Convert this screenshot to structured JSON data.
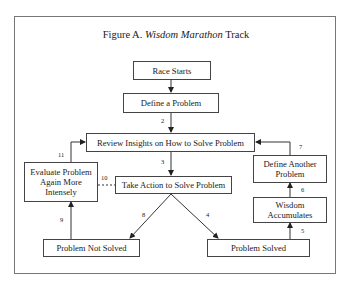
{
  "figure": {
    "title_prefix": "Figure A.",
    "title_italic": "Wisdom Marathon",
    "title_suffix": "Track"
  },
  "nodes": {
    "race_starts": "Race Starts",
    "define_problem": "Define a Problem",
    "review_insights": "Review Insights on How to Solve Problem",
    "take_action": "Take Action to Solve Problem",
    "evaluate_again": "Evaluate Problem Again More Intensely",
    "problem_not_solved": "Problem Not Solved",
    "problem_solved": "Problem Solved",
    "wisdom_accumulates": "Wisdom Accumulates",
    "define_another": "Define Another Problem"
  },
  "edges": [
    {
      "from": "race_starts",
      "to": "define_problem",
      "label": ""
    },
    {
      "from": "define_problem",
      "to": "review_insights",
      "label": "2"
    },
    {
      "from": "review_insights",
      "to": "take_action",
      "label": "3"
    },
    {
      "from": "take_action",
      "to": "problem_solved",
      "label": "4"
    },
    {
      "from": "problem_solved",
      "to": "wisdom_accumulates",
      "label": "5"
    },
    {
      "from": "wisdom_accumulates",
      "to": "define_another",
      "label": "6"
    },
    {
      "from": "define_another",
      "to": "review_insights",
      "label": "7"
    },
    {
      "from": "take_action",
      "to": "problem_not_solved",
      "label": "8"
    },
    {
      "from": "problem_not_solved",
      "to": "evaluate_again",
      "label": "9"
    },
    {
      "from": "evaluate_again",
      "to": "take_action",
      "label": "10",
      "style": "dashed"
    },
    {
      "from": "evaluate_again",
      "to": "review_insights",
      "label": "11"
    }
  ],
  "labels": {
    "e2": "2",
    "e3": "3",
    "e4": "4",
    "e5": "5",
    "e6": "6",
    "e7": "7",
    "e8": "8",
    "e9": "9",
    "e10": "10",
    "e11": "11"
  }
}
